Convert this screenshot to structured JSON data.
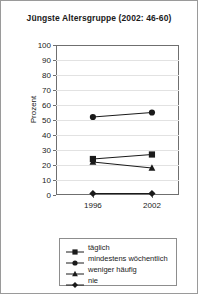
{
  "chart_data": {
    "type": "line",
    "title": "Jüngste Altersgruppe (2002: 46-60)",
    "xlabel": "",
    "ylabel": "Prozent",
    "categories": [
      "1996",
      "2002"
    ],
    "x": [
      1996,
      2002
    ],
    "ylim": [
      0,
      100
    ],
    "ytick_step": 10,
    "yticks": [
      "0",
      "10",
      "20",
      "30",
      "40",
      "50",
      "60",
      "70",
      "80",
      "90",
      "100"
    ],
    "grid": true,
    "legend_position": "bottom",
    "series": [
      {
        "name": "täglich",
        "marker": "square",
        "color": "#1a1a1a",
        "values": [
          24,
          27
        ]
      },
      {
        "name": "mindestens wöchentlich",
        "marker": "circle",
        "color": "#1a1a1a",
        "values": [
          52,
          55
        ]
      },
      {
        "name": "weniger häufig",
        "marker": "triangle",
        "color": "#1a1a1a",
        "values": [
          22,
          18
        ]
      },
      {
        "name": "nie",
        "marker": "diamond",
        "color": "#1a1a1a",
        "values": [
          1,
          1
        ]
      }
    ]
  }
}
